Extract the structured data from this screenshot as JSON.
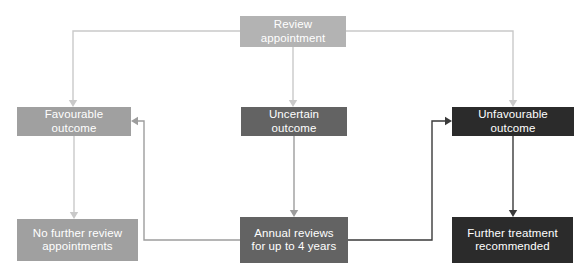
{
  "diagram": {
    "background": "#ffffff",
    "width": 583,
    "height": 270
  },
  "palette": {
    "light_gray": "#b3b3b3",
    "mid_gray": "#a0a0a0",
    "medium_gray": "#636363",
    "dark": "#2b2b2b",
    "text": "#ffffff",
    "edge_light": "#c9c9c9",
    "edge_mid": "#9d9d9d",
    "edge_dark": "#3a3a3a"
  },
  "nodes": [
    {
      "id": "review-appointment",
      "label": "Review appointment",
      "x": 240,
      "y": 16,
      "w": 106,
      "h": 31,
      "fill": "#b3b3b3"
    },
    {
      "id": "favourable-outcome",
      "label": "Favourable outcome",
      "x": 17,
      "y": 107,
      "w": 114,
      "h": 29,
      "fill": "#a0a0a0"
    },
    {
      "id": "uncertain-outcome",
      "label": "Uncertain outcome",
      "x": 241,
      "y": 107,
      "w": 106,
      "h": 29,
      "fill": "#636363"
    },
    {
      "id": "unfavourable-outcome",
      "label": "Unfavourable outcome",
      "x": 452,
      "y": 107,
      "w": 122,
      "h": 29,
      "fill": "#2b2b2b"
    },
    {
      "id": "no-further-review-appointments",
      "label": "No further review\nappointments",
      "x": 17,
      "y": 219,
      "w": 121,
      "h": 42,
      "fill": "#a0a0a0"
    },
    {
      "id": "annual-reviews",
      "label": "Annual reviews\nfor up to 4 years",
      "x": 240,
      "y": 217,
      "w": 108,
      "h": 46,
      "fill": "#636363"
    },
    {
      "id": "further-treatment-recommended",
      "label": "Further treatment\nrecommended",
      "x": 452,
      "y": 217,
      "w": 121,
      "h": 46,
      "fill": "#2b2b2b"
    }
  ],
  "edges": [
    {
      "id": "review-to-favourable",
      "from": "review-appointment",
      "to": "favourable-outcome",
      "color": "#c9c9c9",
      "path": "M 240 31 L 73 31 L 73 101",
      "arrow_at": [
        73,
        107
      ]
    },
    {
      "id": "review-to-uncertain",
      "from": "review-appointment",
      "to": "uncertain-outcome",
      "color": "#c9c9c9",
      "path": "M 293 47 L 293 101",
      "arrow_at": [
        293,
        107
      ]
    },
    {
      "id": "review-to-unfavourable",
      "from": "review-appointment",
      "to": "unfavourable-outcome",
      "color": "#c9c9c9",
      "path": "M 346 31 L 513 31 L 513 101",
      "arrow_at": [
        513,
        107
      ]
    },
    {
      "id": "favourable-to-no-further-review",
      "from": "favourable-outcome",
      "to": "no-further-review-appointments",
      "color": "#c9c9c9",
      "path": "M 74 136 L 74 213",
      "arrow_at": [
        74,
        219
      ]
    },
    {
      "id": "uncertain-to-annual-reviews",
      "from": "uncertain-outcome",
      "to": "annual-reviews",
      "color": "#9d9d9d",
      "path": "M 294 136 L 294 211",
      "arrow_at": [
        294,
        217
      ]
    },
    {
      "id": "unfavourable-to-further-treatment",
      "from": "unfavourable-outcome",
      "to": "further-treatment-recommended",
      "color": "#3a3a3a",
      "path": "M 513 136 L 513 211",
      "arrow_at": [
        513,
        217
      ]
    },
    {
      "id": "annual-reviews-to-favourable",
      "from": "annual-reviews",
      "to": "favourable-outcome",
      "color": "#9d9d9d",
      "path": "M 240 240 L 144 240 L 144 121 L 137 121",
      "arrow_at": [
        131,
        121
      ]
    },
    {
      "id": "annual-reviews-to-unfavourable",
      "from": "annual-reviews",
      "to": "unfavourable-outcome",
      "color": "#3a3a3a",
      "path": "M 348 240 L 432 240 L 432 121 L 446 121",
      "arrow_at": [
        452,
        121
      ]
    }
  ]
}
